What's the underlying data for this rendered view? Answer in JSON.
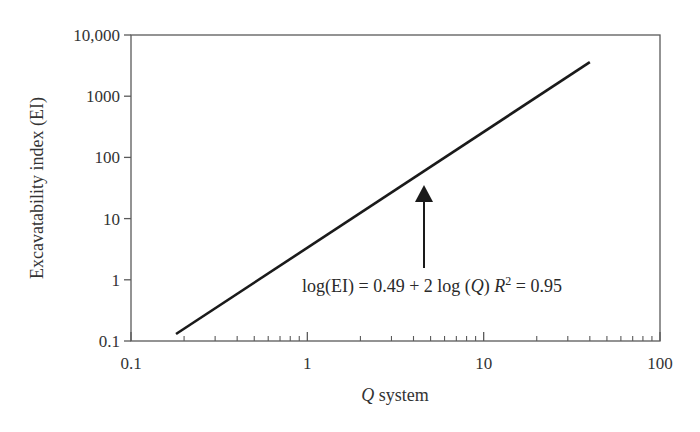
{
  "chart_data": {
    "type": "line",
    "title": "",
    "xlabel": "Q system",
    "xlabel_italic_part": "Q",
    "xlabel_rest": " system",
    "ylabel": "Excavatability index (EI)",
    "xscale": "log",
    "yscale": "log",
    "xlim": [
      0.1,
      100
    ],
    "ylim": [
      0.1,
      10000
    ],
    "x_ticks": [
      "0.1",
      "1",
      "10",
      "100"
    ],
    "y_ticks": [
      "0.1",
      "1",
      "10",
      "100",
      "1000",
      "10,000"
    ],
    "grid": false,
    "legend": null,
    "series": [
      {
        "name": "log(EI) = 0.49 + 2 log(Q)",
        "x": [
          0.18,
          40
        ],
        "y": [
          0.13,
          3600
        ]
      }
    ],
    "annotations": [
      {
        "text": "log(EI) = 0.49 + 2 log (Q) R² = 0.95",
        "equation": "log(EI) = 0.49 + 2 log (Q)",
        "r_squared": 0.95,
        "arrow_x": 4.7,
        "arrow_points_to_y": 50
      }
    ]
  },
  "labels": {
    "eq_main": "log(EI) = 0.49 + 2 log (",
    "eq_q": "Q",
    "eq_close": ") ",
    "eq_r": "R",
    "eq_sup": "2",
    "eq_rest": " = 0.95"
  },
  "colors": {
    "line": "#1a1a1a",
    "axis": "#555555",
    "text": "#333333"
  }
}
